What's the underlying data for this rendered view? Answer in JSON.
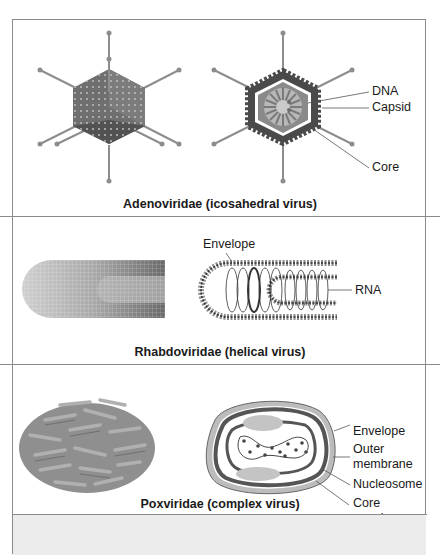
{
  "figure": {
    "panels": [
      {
        "id": "adenoviridae",
        "caption": "Adenoviridae (icosahedral virus)",
        "labels": [
          "DNA",
          "Capsid",
          "Core"
        ]
      },
      {
        "id": "rhabdoviridae",
        "caption": "Rhabdoviridae (helical virus)",
        "labels": [
          "Envelope",
          "RNA"
        ]
      },
      {
        "id": "poxviridae",
        "caption": "Poxviridae (complex virus)",
        "labels": [
          "Envelope",
          "Outer membrane",
          "Nucleosome",
          "Core membrane"
        ],
        "label_lines": {
          "outer_membrane": [
            "Outer",
            "membrane"
          ],
          "core_membrane": [
            "Core",
            "membrane"
          ]
        }
      }
    ],
    "colors": {
      "border": "#8a8a8a",
      "structure_dark": "#555555",
      "structure_mid": "#8c8c8c",
      "structure_light": "#c4c4c4",
      "footer_bg": "#ececec"
    }
  }
}
